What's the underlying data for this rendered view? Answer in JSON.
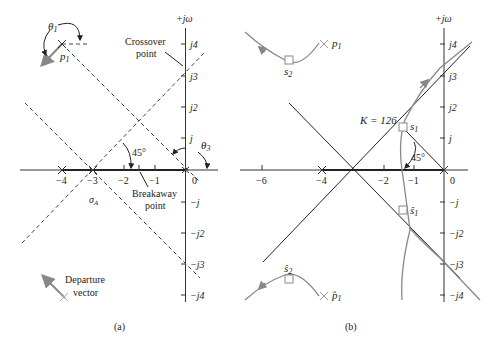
{
  "panel_a": {
    "caption": "(a)",
    "axis_label": "+jω",
    "x_ticks": [
      "−4",
      "−3",
      "−2",
      "−1",
      "0"
    ],
    "y_ticks_pos": [
      "j",
      "j2",
      "j3",
      "j4"
    ],
    "y_ticks_neg": [
      "−j",
      "−j2",
      "−j3",
      "−j4"
    ],
    "theta1": "θ",
    "theta1_sub": "1",
    "theta3": "θ",
    "theta3_sub": "3",
    "p1": "p",
    "p1_sub": "1",
    "angle_45": "45°",
    "sigma_a": "σ",
    "sigma_a_sub": "A",
    "crossover_line1": "Crossover",
    "crossover_line2": "point",
    "breakaway_line1": "Breakaway",
    "breakaway_line2": "point",
    "departure_line1": "Departure",
    "departure_line2": "vector"
  },
  "panel_b": {
    "caption": "(b)",
    "axis_label": "+jω",
    "x_ticks": [
      "−6",
      "−4",
      "−2",
      "−1",
      "0"
    ],
    "y_ticks_pos": [
      "j",
      "j2",
      "j3",
      "j4"
    ],
    "y_ticks_neg": [
      "−j",
      "−j2",
      "−j3",
      "−j4"
    ],
    "k_label": "K = 126",
    "s1": "s",
    "s1_sub": "1",
    "s1_hat": "ŝ",
    "s2": "s",
    "s2_sub": "2",
    "s2_hat": "ŝ",
    "p1": "p",
    "p1_sub": "1",
    "p1_hat": "p̂",
    "angle_45": "45°"
  },
  "colors": {
    "axis": "#333333",
    "locus": "#8a8a8a",
    "asymptote": "#222222"
  }
}
